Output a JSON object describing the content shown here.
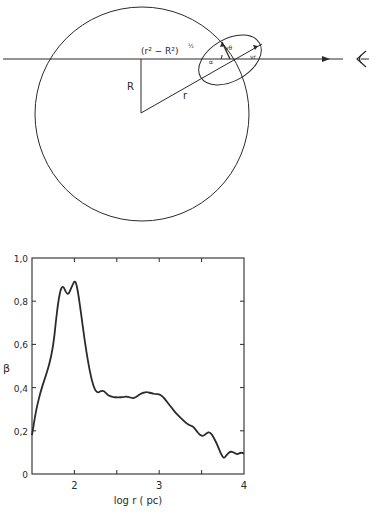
{
  "diagram": {
    "labels": {
      "projection": "(r² − R²)",
      "projection_exp": "½",
      "R": "R",
      "r": "r",
      "v_theta": "vθ",
      "v_r": "vr",
      "alpha": "α"
    },
    "icons": [
      "arrow-right-icon",
      "eye-icon"
    ]
  },
  "chart_data": {
    "type": "line",
    "title": "",
    "xlabel": "log r ( pc)",
    "ylabel": "β",
    "xlim": [
      1.5,
      4.0
    ],
    "ylim": [
      0,
      1.0
    ],
    "xticks": [
      2,
      2.5,
      3,
      3.5,
      4
    ],
    "xtick_labels": [
      "2",
      "",
      "3",
      "",
      "4"
    ],
    "yticks": [
      0,
      0.2,
      0.4,
      0.6,
      0.8,
      1.0
    ],
    "ytick_labels": [
      "0",
      "0,2",
      "0,4",
      "0,6",
      "0,8",
      "1,0"
    ],
    "grid": false,
    "legend": null,
    "series": [
      {
        "name": "beta",
        "x": [
          1.5,
          1.55,
          1.6,
          1.65,
          1.7,
          1.75,
          1.78,
          1.81,
          1.84,
          1.87,
          1.9,
          1.93,
          1.97,
          2.01,
          2.04,
          2.08,
          2.12,
          2.16,
          2.2,
          2.24,
          2.28,
          2.31,
          2.35,
          2.38,
          2.42,
          2.48,
          2.55,
          2.62,
          2.68,
          2.72,
          2.76,
          2.8,
          2.85,
          2.9,
          2.95,
          3.0,
          3.04,
          3.08,
          3.12,
          3.16,
          3.2,
          3.24,
          3.28,
          3.32,
          3.36,
          3.4,
          3.44,
          3.48,
          3.52,
          3.56,
          3.6,
          3.64,
          3.68,
          3.72,
          3.76,
          3.8,
          3.84,
          3.88,
          3.92,
          3.96,
          4.0
        ],
        "y": [
          0.18,
          0.3,
          0.38,
          0.44,
          0.5,
          0.59,
          0.7,
          0.8,
          0.86,
          0.87,
          0.84,
          0.83,
          0.87,
          0.9,
          0.85,
          0.74,
          0.62,
          0.52,
          0.44,
          0.39,
          0.375,
          0.385,
          0.385,
          0.37,
          0.36,
          0.355,
          0.355,
          0.36,
          0.35,
          0.355,
          0.365,
          0.375,
          0.38,
          0.375,
          0.37,
          0.37,
          0.36,
          0.34,
          0.32,
          0.3,
          0.28,
          0.265,
          0.25,
          0.235,
          0.225,
          0.22,
          0.2,
          0.18,
          0.175,
          0.19,
          0.195,
          0.17,
          0.14,
          0.1,
          0.07,
          0.09,
          0.105,
          0.1,
          0.09,
          0.1,
          0.095
        ]
      }
    ]
  }
}
